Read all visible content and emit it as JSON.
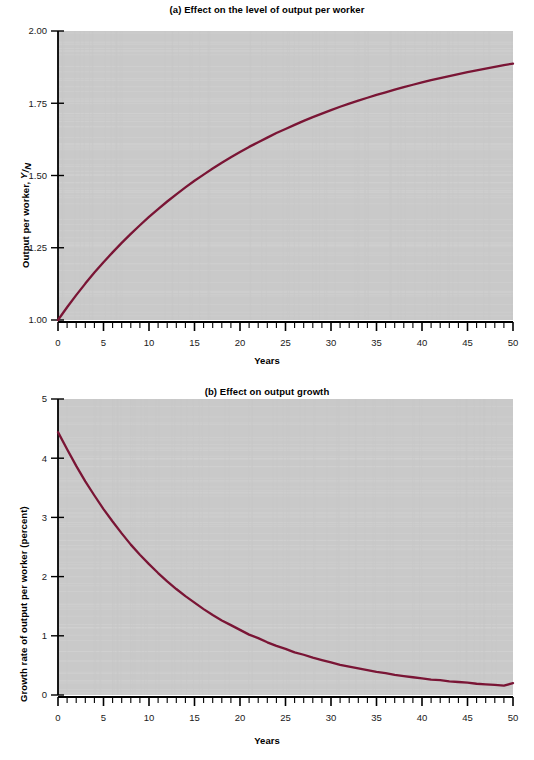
{
  "figure": {
    "background_color": "#ffffff",
    "plot_background_color": "#c9c9c9",
    "axis_color": "#000000",
    "curve_color": "#7a1535"
  },
  "panel_a": {
    "title": "(a) Effect on the level of output per worker",
    "ylabel_main": "Output per worker, ",
    "ylabel_numerator": "Y",
    "ylabel_slash": "/",
    "ylabel_denominator": "N",
    "xlabel": "Years",
    "ytick_labels": [
      "2.00",
      "1.75",
      "1.50",
      "1.25",
      "1.00"
    ],
    "xtick_labels": [
      "0",
      "5",
      "10",
      "15",
      "20",
      "25",
      "30",
      "35",
      "40",
      "45",
      "50"
    ]
  },
  "panel_b": {
    "title": "(b) Effect on output growth",
    "ylabel": "Growth rate of output per worker (percent)",
    "xlabel": "Years",
    "ytick_labels": [
      "5",
      "4",
      "3",
      "2",
      "1",
      "0"
    ],
    "xtick_labels": [
      "0",
      "5",
      "10",
      "15",
      "20",
      "25",
      "30",
      "35",
      "40",
      "45",
      "50"
    ]
  },
  "chart_data": [
    {
      "type": "line",
      "title": "(a) Effect on the level of output per worker",
      "xlabel": "Years",
      "ylabel": "Output per worker, Y/N",
      "xlim": [
        0,
        50
      ],
      "ylim": [
        1.0,
        2.0
      ],
      "xticks": [
        0,
        5,
        10,
        15,
        20,
        25,
        30,
        35,
        40,
        45,
        50
      ],
      "xtick_labels": [
        "0",
        "5",
        "10",
        "15",
        "20",
        "25",
        "30",
        "35",
        "40",
        "45",
        "50"
      ],
      "yticks": [
        1.0,
        1.25,
        1.5,
        1.75,
        2.0
      ],
      "ytick_labels": [
        "1.00",
        "1.25",
        "1.50",
        "1.75",
        "2.00"
      ],
      "minor_xtick_interval": 1,
      "grid": false,
      "legend": null,
      "series": [
        {
          "name": "Output per worker",
          "color": "#7a1535",
          "x": [
            0,
            1,
            2,
            3,
            4,
            5,
            6,
            7,
            8,
            9,
            10,
            11,
            12,
            13,
            14,
            15,
            16,
            17,
            18,
            19,
            20,
            21,
            22,
            23,
            24,
            25,
            26,
            27,
            28,
            29,
            30,
            31,
            32,
            33,
            34,
            35,
            36,
            37,
            38,
            39,
            40,
            41,
            42,
            43,
            44,
            45,
            46,
            47,
            48,
            49,
            50
          ],
          "values": [
            1.0,
            1.044,
            1.086,
            1.126,
            1.164,
            1.2,
            1.234,
            1.267,
            1.298,
            1.328,
            1.357,
            1.384,
            1.41,
            1.435,
            1.459,
            1.482,
            1.503,
            1.524,
            1.544,
            1.563,
            1.581,
            1.599,
            1.615,
            1.631,
            1.647,
            1.661,
            1.675,
            1.689,
            1.702,
            1.714,
            1.726,
            1.738,
            1.749,
            1.759,
            1.769,
            1.779,
            1.788,
            1.797,
            1.806,
            1.814,
            1.822,
            1.83,
            1.837,
            1.844,
            1.851,
            1.858,
            1.864,
            1.87,
            1.876,
            1.882,
            1.887
          ]
        }
      ]
    },
    {
      "type": "line",
      "title": "(b) Effect on output growth",
      "xlabel": "Years",
      "ylabel": "Growth rate of output per worker (percent)",
      "xlim": [
        0,
        50
      ],
      "ylim": [
        0,
        5
      ],
      "xticks": [
        0,
        5,
        10,
        15,
        20,
        25,
        30,
        35,
        40,
        45,
        50
      ],
      "xtick_labels": [
        "0",
        "5",
        "10",
        "15",
        "20",
        "25",
        "30",
        "35",
        "40",
        "45",
        "50"
      ],
      "yticks": [
        0,
        1,
        2,
        3,
        4,
        5
      ],
      "ytick_labels": [
        "0",
        "1",
        "2",
        "3",
        "4",
        "5"
      ],
      "minor_xtick_interval": 1,
      "grid": false,
      "legend": null,
      "series": [
        {
          "name": "Growth rate of output per worker",
          "color": "#7a1535",
          "x": [
            0,
            1,
            2,
            3,
            4,
            5,
            6,
            7,
            8,
            9,
            10,
            11,
            12,
            13,
            14,
            15,
            16,
            17,
            18,
            19,
            20,
            21,
            22,
            23,
            24,
            25,
            26,
            27,
            28,
            29,
            30,
            31,
            32,
            33,
            34,
            35,
            36,
            37,
            38,
            39,
            40,
            41,
            42,
            43,
            44,
            45,
            46,
            47,
            48,
            49,
            50
          ],
          "values": [
            4.44,
            4.15,
            3.87,
            3.61,
            3.37,
            3.14,
            2.93,
            2.73,
            2.54,
            2.37,
            2.21,
            2.06,
            1.92,
            1.79,
            1.67,
            1.56,
            1.45,
            1.35,
            1.26,
            1.18,
            1.1,
            1.02,
            0.96,
            0.89,
            0.83,
            0.78,
            0.72,
            0.68,
            0.63,
            0.59,
            0.55,
            0.51,
            0.48,
            0.45,
            0.42,
            0.39,
            0.37,
            0.34,
            0.32,
            0.3,
            0.28,
            0.26,
            0.25,
            0.23,
            0.22,
            0.21,
            0.19,
            0.18,
            0.17,
            0.16,
            0.2
          ]
        }
      ]
    }
  ]
}
